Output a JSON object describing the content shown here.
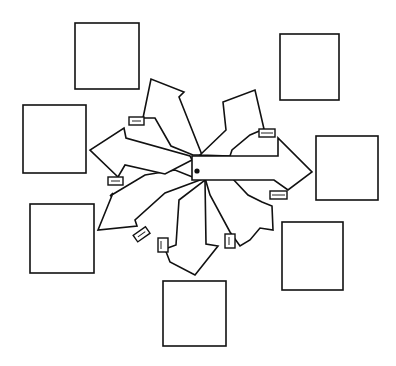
{
  "diagram": {
    "background": "#ffffff",
    "stroke_color": "#111111",
    "boxes": [
      {
        "id": "box-top-left",
        "label": ""
      },
      {
        "id": "box-left-upper",
        "label": ""
      },
      {
        "id": "box-top-right",
        "label": ""
      },
      {
        "id": "box-right",
        "label": ""
      },
      {
        "id": "box-right-lower",
        "label": ""
      },
      {
        "id": "box-bottom",
        "label": ""
      },
      {
        "id": "box-left-lower",
        "label": ""
      }
    ],
    "central_arrow": {
      "direction": "right",
      "marker": "dot"
    },
    "arrows": [
      {
        "direction": "up-left"
      },
      {
        "direction": "up-right"
      },
      {
        "direction": "left"
      },
      {
        "direction": "down-left"
      },
      {
        "direction": "down"
      },
      {
        "direction": "down-right"
      },
      {
        "direction": "right"
      }
    ]
  }
}
